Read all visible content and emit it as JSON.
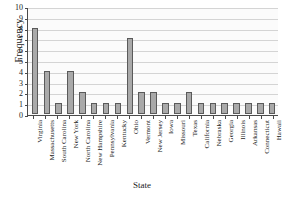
{
  "chart_data": {
    "type": "bar",
    "title": "",
    "xlabel": "State",
    "ylabel": "Frequency",
    "categories": [
      "Virginia",
      "Massachusetts",
      "South Carolina",
      "New York",
      "North Carolina",
      "New Hampshire",
      "Pennsylvania",
      "Kentucky",
      "Ohio",
      "Vermont",
      "New Jersey",
      "Iowa",
      "Missouri",
      "Texas",
      "California",
      "Nebraska",
      "Georgia",
      "Illinois",
      "Arkansas",
      "Connecticut",
      "Hawaii"
    ],
    "values": [
      8,
      4,
      1,
      4,
      2,
      1,
      1,
      1,
      7,
      2,
      2,
      1,
      1,
      2,
      1,
      1,
      1,
      1,
      1,
      1,
      1
    ],
    "ylim": [
      0,
      10
    ],
    "yticks": [
      0,
      1,
      2,
      3,
      4,
      5,
      6,
      7,
      8,
      9,
      10
    ],
    "ytick_labels": [
      "0",
      "1",
      "2",
      "3",
      "4",
      "5",
      "6",
      "7",
      "8",
      "9",
      "10"
    ],
    "grid": true,
    "grid_axis": "y",
    "legend": false,
    "bar_color": "#a9a9a9",
    "bar_edge_color": "#5a5a5a",
    "axis_color": "#4a4a4a",
    "grid_color": "#d4d4d4",
    "plot_background": "#fbfbfb",
    "figure_background": "#ffffff"
  }
}
